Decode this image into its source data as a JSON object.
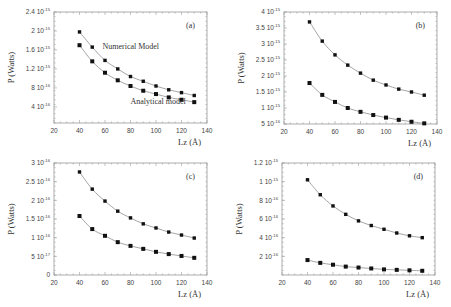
{
  "chart_data": [
    {
      "id": "a",
      "type": "line",
      "panel_label": "(a)",
      "xlabel": "Lz (Å)",
      "ylabel": "P (Watts)",
      "xlim": [
        20,
        140
      ],
      "xticks": [
        20,
        40,
        60,
        80,
        100,
        120,
        140
      ],
      "ylim": [
        6e-17,
        2.4e-15
      ],
      "yticks": [
        {
          "value": 2.4e-15,
          "mantissa": "2.4",
          "exp": "-15"
        },
        {
          "value": 2e-15,
          "mantissa": "2",
          "exp": "-15"
        },
        {
          "value": 1.6e-15,
          "mantissa": "1.6",
          "exp": "-15"
        },
        {
          "value": 1.2e-15,
          "mantissa": "1.2",
          "exp": "-15"
        },
        {
          "value": 8e-16,
          "mantissa": "8",
          "exp": "-16"
        },
        {
          "value": 4e-16,
          "mantissa": "4",
          "exp": "-16"
        }
      ],
      "x": [
        40,
        50,
        60,
        70,
        80,
        90,
        100,
        110,
        120,
        130
      ],
      "series": [
        {
          "name": "Numerical Model",
          "marker": "circle",
          "values": [
            1.98e-15,
            1.66e-15,
            1.38e-15,
            1.2e-15,
            1.04e-15,
            9.4e-16,
            8.4e-16,
            7.6e-16,
            7e-16,
            6.4e-16
          ]
        },
        {
          "name": "Analytical model",
          "marker": "square",
          "values": [
            1.7e-15,
            1.36e-15,
            1.12e-15,
            9.6e-16,
            8.4e-16,
            7.4e-16,
            6.7e-16,
            6e-16,
            5.5e-16,
            5e-16
          ]
        }
      ],
      "annotations": [
        {
          "text": "Numerical Model",
          "x": 58,
          "y": 1.62e-15
        },
        {
          "text": "Analytical model",
          "x": 80,
          "y": 4.6e-16
        }
      ],
      "frame": {
        "left": 54,
        "top": 12,
        "width": 153,
        "height": 111
      }
    },
    {
      "id": "b",
      "type": "line",
      "panel_label": "(b)",
      "xlabel": "Lz (Å)",
      "ylabel": "P (Watts)",
      "xlim": [
        20,
        140
      ],
      "xticks": [
        20,
        40,
        60,
        80,
        100,
        120,
        140
      ],
      "ylim": [
        5e-16,
        4e-15
      ],
      "yticks": [
        {
          "value": 4e-15,
          "mantissa": "4",
          "exp": "-15"
        },
        {
          "value": 3.5e-15,
          "mantissa": "3.5",
          "exp": "-15"
        },
        {
          "value": 3e-15,
          "mantissa": "3",
          "exp": "-15"
        },
        {
          "value": 2.5e-15,
          "mantissa": "2.5",
          "exp": "-15"
        },
        {
          "value": 2e-15,
          "mantissa": "2",
          "exp": "-15"
        },
        {
          "value": 1.5e-15,
          "mantissa": "1.5",
          "exp": "-15"
        },
        {
          "value": 1e-15,
          "mantissa": "1",
          "exp": "-15"
        },
        {
          "value": 5e-16,
          "mantissa": "5",
          "exp": "-16"
        }
      ],
      "x": [
        40,
        50,
        60,
        70,
        80,
        90,
        100,
        110,
        120,
        130
      ],
      "series": [
        {
          "name": "Numerical Model",
          "marker": "circle",
          "values": [
            3.69e-15,
            3.09e-15,
            2.66e-15,
            2.34e-15,
            2.09e-15,
            1.87e-15,
            1.72e-15,
            1.59e-15,
            1.5e-15,
            1.4e-15
          ]
        },
        {
          "name": "Analytical model",
          "marker": "square",
          "values": [
            1.78e-15,
            1.41e-15,
            1.19e-15,
            1e-15,
            8.8e-16,
            7.8e-16,
            7e-16,
            6.3e-16,
            5.7e-16,
            5.2e-16
          ]
        }
      ],
      "annotations": [],
      "frame": {
        "left": 284,
        "top": 12,
        "width": 153,
        "height": 112
      }
    },
    {
      "id": "c",
      "type": "line",
      "panel_label": "(c)",
      "xlabel": "Lz (Å)",
      "ylabel": "P (Watts)",
      "xlim": [
        20,
        140
      ],
      "xticks": [
        20,
        40,
        60,
        80,
        100,
        120,
        140
      ],
      "ylim": [
        0,
        3e-16
      ],
      "yticks": [
        {
          "value": 3e-16,
          "mantissa": "3",
          "exp": "-16"
        },
        {
          "value": 2.5e-16,
          "mantissa": "2.5",
          "exp": "-16"
        },
        {
          "value": 2e-16,
          "mantissa": "2",
          "exp": "-16"
        },
        {
          "value": 1.5e-16,
          "mantissa": "1.5",
          "exp": "-16"
        },
        {
          "value": 1e-16,
          "mantissa": "1",
          "exp": "-16"
        },
        {
          "value": 5e-17,
          "mantissa": "5",
          "exp": "-17"
        },
        {
          "value": 0,
          "mantissa": "0",
          "exp": ""
        }
      ],
      "x": [
        40,
        50,
        60,
        70,
        80,
        90,
        100,
        110,
        120,
        130
      ],
      "series": [
        {
          "name": "Numerical Model",
          "marker": "circle",
          "values": [
            2.76e-16,
            2.3e-16,
            1.98e-16,
            1.71e-16,
            1.53e-16,
            1.37e-16,
            1.26e-16,
            1.15e-16,
            1.07e-16,
            9.9e-17
          ]
        },
        {
          "name": "Analytical model",
          "marker": "square",
          "values": [
            1.58e-16,
            1.23e-16,
            1.05e-16,
            8.8e-17,
            7.8e-17,
            7e-17,
            6.2e-17,
            5.6e-17,
            5.1e-17,
            4.6e-17
          ]
        }
      ],
      "annotations": [],
      "frame": {
        "left": 54,
        "top": 163,
        "width": 153,
        "height": 112
      }
    },
    {
      "id": "d",
      "type": "line",
      "panel_label": "(d)",
      "xlabel": "Lz (Å)",
      "ylabel": "P (Watts)",
      "xlim": [
        20,
        140
      ],
      "xticks": [
        20,
        40,
        60,
        80,
        100,
        120,
        140
      ],
      "ylim": [
        0,
        1.2e-15
      ],
      "yticks": [
        {
          "value": 1.2e-15,
          "mantissa": "1.2",
          "exp": "-15"
        },
        {
          "value": 1e-15,
          "mantissa": "1",
          "exp": "-15"
        },
        {
          "value": 8e-16,
          "mantissa": "8",
          "exp": "-16"
        },
        {
          "value": 6e-16,
          "mantissa": "6",
          "exp": "-16"
        },
        {
          "value": 4e-16,
          "mantissa": "4",
          "exp": "-16"
        },
        {
          "value": 2e-16,
          "mantissa": "2",
          "exp": "-16"
        }
      ],
      "x": [
        40,
        50,
        60,
        70,
        80,
        90,
        100,
        110,
        120,
        130
      ],
      "series": [
        {
          "name": "Numerical Model",
          "marker": "circle",
          "values": [
            1.02e-15,
            8.6e-16,
            7.4e-16,
            6.5e-16,
            5.8e-16,
            5.3e-16,
            4.9e-16,
            4.5e-16,
            4.2e-16,
            4e-16
          ]
        },
        {
          "name": "Analytical model",
          "marker": "square",
          "values": [
            1.6e-16,
            1.3e-16,
            1.1e-16,
            9e-17,
            8e-17,
            7e-17,
            6e-17,
            5.5e-17,
            5e-17,
            4.5e-17
          ]
        }
      ],
      "annotations": [],
      "frame": {
        "left": 282,
        "top": 163,
        "width": 153,
        "height": 112
      }
    }
  ],
  "colors": {
    "frame": "#9a9a9a",
    "curve": "#9a9a9a",
    "marker": "#111111",
    "text": "#333333"
  }
}
